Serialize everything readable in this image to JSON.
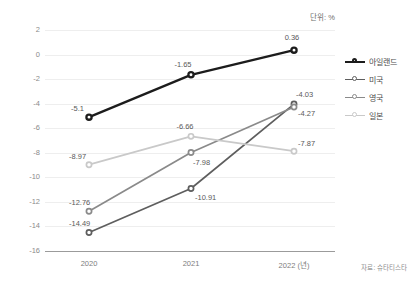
{
  "chart_data": {
    "type": "line",
    "title": "",
    "subtitle": "",
    "unit_label": "단위: %",
    "xlabel": "",
    "ylabel": "",
    "categories": [
      "2020",
      "2021",
      "2022 (년)"
    ],
    "x": [
      2020,
      2021,
      2022
    ],
    "ylim": [
      -16,
      2
    ],
    "yticks": [
      "2",
      "0",
      "-2",
      "-4",
      "-6",
      "-8",
      "-10",
      "-12",
      "-14",
      "-16"
    ],
    "ytick_values": [
      2,
      0,
      -2,
      -4,
      -6,
      -8,
      -10,
      -12,
      -14,
      -16
    ],
    "grid": true,
    "legend_position": "right",
    "source": "자료: 슈타티스타",
    "series": [
      {
        "name": "아일랜드",
        "color": "#1c1c1c",
        "values": [
          -5.1,
          -1.65,
          0.36
        ],
        "labels": [
          "-5.1",
          "-1.65",
          "0.36"
        ]
      },
      {
        "name": "미국",
        "color": "#5e5e5e",
        "values": [
          -14.49,
          -10.91,
          -4.03
        ],
        "labels": [
          "-14.49",
          "-10.91",
          "-4.03"
        ]
      },
      {
        "name": "영국",
        "color": "#8a8a8a",
        "values": [
          -12.76,
          -7.98,
          -4.27
        ],
        "labels": [
          "-12.76",
          "-7.98",
          "-4.27"
        ]
      },
      {
        "name": "일본",
        "color": "#c9c9c9",
        "values": [
          -8.97,
          -6.66,
          -7.87
        ],
        "labels": [
          "-8.97",
          "-6.66",
          "-7.87"
        ]
      }
    ]
  },
  "legend": {
    "items": [
      {
        "label": "아일랜드"
      },
      {
        "label": "미국"
      },
      {
        "label": "영국"
      },
      {
        "label": "일본"
      }
    ]
  },
  "axes": {
    "y": {
      "labels": [
        "2",
        "0",
        "-2",
        "-4",
        "-6",
        "-8",
        "-10",
        "-12",
        "-14",
        "-16"
      ]
    },
    "x": {
      "labels": [
        "2020",
        "2021",
        "2022 (년)"
      ]
    }
  },
  "footer": {
    "source": "자료: 슈타티스타"
  }
}
